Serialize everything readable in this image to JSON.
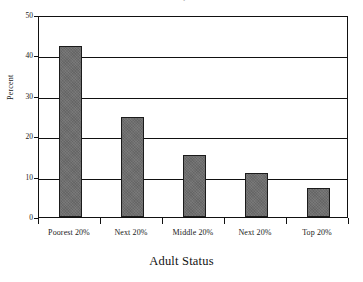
{
  "figure": {
    "background_color": "#ffffff",
    "bar_fill_color": "#6e6e6e",
    "bar_edge_color": "#1b1b1b",
    "axis_color": "#111111",
    "title_remnant": "' ."
  },
  "chart_data": {
    "type": "bar",
    "title": "",
    "xlabel": "Adult Status",
    "ylabel": "Percent",
    "categories": [
      "Poorest 20%",
      "Next 20%",
      "Middle 20%",
      "Next 20%",
      "Top 20%"
    ],
    "values": [
      42.3,
      24.7,
      15.4,
      10.8,
      7.2
    ],
    "ylim": [
      0,
      50
    ],
    "yticks": [
      0,
      10,
      20,
      30,
      40,
      50
    ],
    "ytick_labels": [
      "0",
      "10",
      "20",
      "30",
      "40",
      "50"
    ],
    "grid": "horizontal",
    "legend": "none",
    "series": [
      {
        "name": "Percent",
        "values": [
          42.3,
          24.7,
          15.4,
          10.8,
          7.2
        ]
      }
    ]
  }
}
